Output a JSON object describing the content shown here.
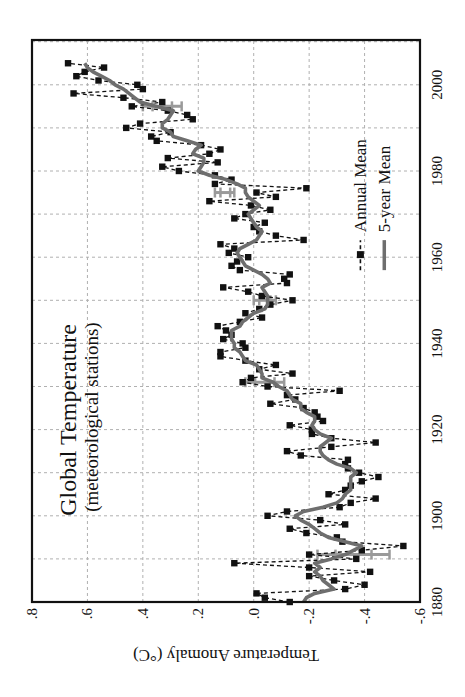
{
  "chart_data": {
    "type": "line",
    "title": "Global Temperature",
    "subtitle": "(meteorological stations)",
    "xlabel": "",
    "ylabel": "Temperature Anomaly (°C)",
    "xlim": [
      1880,
      2010
    ],
    "ylim": [
      -0.6,
      0.8
    ],
    "x_ticks": [
      1880,
      1900,
      1920,
      1940,
      1960,
      1980,
      2000
    ],
    "y_ticks": [
      -0.6,
      -0.4,
      -0.2,
      0.0,
      0.2,
      0.4,
      0.6,
      0.8
    ],
    "y_tick_labels": [
      "-.6",
      "-.4",
      "-.2",
      ".0",
      ".2",
      ".4",
      ".6",
      ".8"
    ],
    "grid": true,
    "orientation": "rotated 90° counter-clockwise",
    "legend": {
      "position": "lower right (inside plot)",
      "entries": [
        "Annual Mean",
        "5-year Mean"
      ]
    },
    "colors": {
      "annual": "#111111",
      "five_year": "#6e6e6e",
      "error_bars": "#9a9a9a",
      "grid": "#b0b0b0"
    },
    "x": [
      1880,
      1881,
      1882,
      1883,
      1884,
      1885,
      1886,
      1887,
      1888,
      1889,
      1890,
      1891,
      1892,
      1893,
      1894,
      1895,
      1896,
      1897,
      1898,
      1899,
      1900,
      1901,
      1902,
      1903,
      1904,
      1905,
      1906,
      1907,
      1908,
      1909,
      1910,
      1911,
      1912,
      1913,
      1914,
      1915,
      1916,
      1917,
      1918,
      1919,
      1920,
      1921,
      1922,
      1923,
      1924,
      1925,
      1926,
      1927,
      1928,
      1929,
      1930,
      1931,
      1932,
      1933,
      1934,
      1935,
      1936,
      1937,
      1938,
      1939,
      1940,
      1941,
      1942,
      1943,
      1944,
      1945,
      1946,
      1947,
      1948,
      1949,
      1950,
      1951,
      1952,
      1953,
      1954,
      1955,
      1956,
      1957,
      1958,
      1959,
      1960,
      1961,
      1962,
      1963,
      1964,
      1965,
      1966,
      1967,
      1968,
      1969,
      1970,
      1971,
      1972,
      1973,
      1974,
      1975,
      1976,
      1977,
      1978,
      1979,
      1980,
      1981,
      1982,
      1983,
      1984,
      1985,
      1986,
      1987,
      1988,
      1989,
      1990,
      1991,
      1992,
      1993,
      1994,
      1995,
      1996,
      1997,
      1998,
      1999,
      2000,
      2001,
      2002,
      2003,
      2004,
      2005
    ],
    "series": [
      {
        "name": "Annual Mean",
        "style": "dashed line with square markers",
        "values": [
          -0.13,
          -0.04,
          -0.01,
          -0.33,
          -0.4,
          -0.29,
          -0.2,
          -0.42,
          -0.2,
          0.07,
          -0.37,
          -0.2,
          -0.39,
          -0.54,
          -0.32,
          -0.3,
          -0.19,
          -0.13,
          -0.33,
          -0.24,
          -0.05,
          -0.12,
          -0.31,
          -0.35,
          -0.44,
          -0.27,
          -0.33,
          -0.35,
          -0.39,
          -0.45,
          -0.38,
          -0.34,
          -0.33,
          -0.34,
          -0.17,
          -0.12,
          -0.28,
          -0.44,
          -0.28,
          -0.21,
          -0.21,
          -0.13,
          -0.25,
          -0.23,
          -0.22,
          -0.18,
          -0.06,
          -0.15,
          -0.12,
          -0.31,
          -0.05,
          0.04,
          0.01,
          -0.14,
          -0.02,
          -0.08,
          0.03,
          0.12,
          0.12,
          0.03,
          0.04,
          0.11,
          0.08,
          0.1,
          0.13,
          0.05,
          -0.03,
          0.03,
          -0.02,
          -0.06,
          -0.14,
          -0.03,
          0.02,
          0.11,
          -0.12,
          -0.11,
          -0.13,
          0.05,
          0.08,
          0.06,
          0.02,
          0.09,
          0.07,
          0.12,
          -0.18,
          -0.08,
          -0.02,
          0.0,
          -0.04,
          0.07,
          0.03,
          -0.06,
          0.01,
          0.16,
          -0.08,
          -0.01,
          -0.19,
          0.14,
          0.08,
          0.14,
          0.27,
          0.33,
          0.13,
          0.31,
          0.16,
          0.12,
          0.19,
          0.35,
          0.37,
          0.3,
          0.46,
          0.41,
          0.22,
          0.24,
          0.31,
          0.44,
          0.33,
          0.47,
          0.65,
          0.4,
          0.42,
          0.56,
          0.64,
          0.61,
          0.54,
          0.67
        ]
      },
      {
        "name": "5-year Mean",
        "style": "thick solid gray line",
        "values": [
          -0.18,
          -0.19,
          -0.22,
          -0.29,
          -0.27,
          -0.25,
          -0.24,
          -0.22,
          -0.24,
          -0.22,
          -0.28,
          -0.33,
          -0.36,
          -0.39,
          -0.33,
          -0.27,
          -0.24,
          -0.22,
          -0.2,
          -0.17,
          -0.15,
          -0.18,
          -0.25,
          -0.3,
          -0.32,
          -0.33,
          -0.35,
          -0.35,
          -0.35,
          -0.35,
          -0.37,
          -0.35,
          -0.3,
          -0.27,
          -0.25,
          -0.24,
          -0.24,
          -0.26,
          -0.28,
          -0.24,
          -0.22,
          -0.21,
          -0.22,
          -0.22,
          -0.19,
          -0.17,
          -0.17,
          -0.14,
          -0.13,
          -0.12,
          -0.09,
          -0.07,
          -0.03,
          -0.03,
          -0.02,
          -0.01,
          0.03,
          0.04,
          0.05,
          0.07,
          0.07,
          0.08,
          0.08,
          0.08,
          0.05,
          0.04,
          0.02,
          0.0,
          -0.04,
          -0.05,
          -0.05,
          -0.05,
          -0.04,
          -0.03,
          -0.06,
          -0.05,
          -0.03,
          0.0,
          0.03,
          0.04,
          0.05,
          0.06,
          0.05,
          0.02,
          -0.01,
          -0.02,
          -0.03,
          -0.01,
          0.0,
          0.01,
          0.02,
          0.0,
          -0.02,
          0.0,
          0.02,
          0.03,
          0.03,
          0.06,
          0.1,
          0.16,
          0.2,
          0.19,
          0.18,
          0.18,
          0.22,
          0.21,
          0.19,
          0.24,
          0.29,
          0.3,
          0.33,
          0.33,
          0.31,
          0.3,
          0.29,
          0.35,
          0.41,
          0.43,
          0.45,
          0.47,
          0.5,
          0.52,
          0.55,
          0.58,
          0.6,
          0.61
        ]
      }
    ],
    "error_bars": [
      {
        "year": 1891,
        "low": -0.49,
        "high": -0.23,
        "center": -0.36
      },
      {
        "year": 1931,
        "low": -0.11,
        "high": 0.03,
        "center": -0.04
      },
      {
        "year": 1950,
        "low": -0.08,
        "high": 0.0,
        "center": -0.04
      },
      {
        "year": 1975,
        "low": 0.07,
        "high": 0.14,
        "center": 0.1
      },
      {
        "year": 1995,
        "low": 0.26,
        "high": 0.4,
        "center": 0.33
      }
    ]
  },
  "labels": {
    "title": "Global Temperature",
    "subtitle": "(meteorological stations)",
    "ylabel": "Temperature Anomaly (°C)",
    "legend_annual": "Annual Mean",
    "legend_five_year": "5-year Mean"
  }
}
